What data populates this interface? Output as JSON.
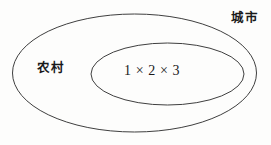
{
  "figure": {
    "type": "venn-diagram",
    "background_color": "#fdfdfc",
    "stroke_color": "#3a3a3a",
    "text_color": "#1a1a1a",
    "width": 271,
    "height": 145
  },
  "shapes": {
    "outer_ellipse": {
      "name": "outer-ellipse",
      "cx": 134.5,
      "cy": 73,
      "rx": 122,
      "ry": 59,
      "stroke": "#3f3f3f",
      "stroke_width": 1,
      "fill": "none"
    },
    "inner_ellipse": {
      "name": "inner-ellipse",
      "cx": 167.5,
      "cy": 74,
      "rx": 76.5,
      "ry": 31,
      "stroke": "#3f3f3f",
      "stroke_width": 1,
      "fill": "none"
    }
  },
  "labels": {
    "outer_region": "城市",
    "annulus_region": "农村",
    "core_expression": "1 × 2 × 3"
  }
}
